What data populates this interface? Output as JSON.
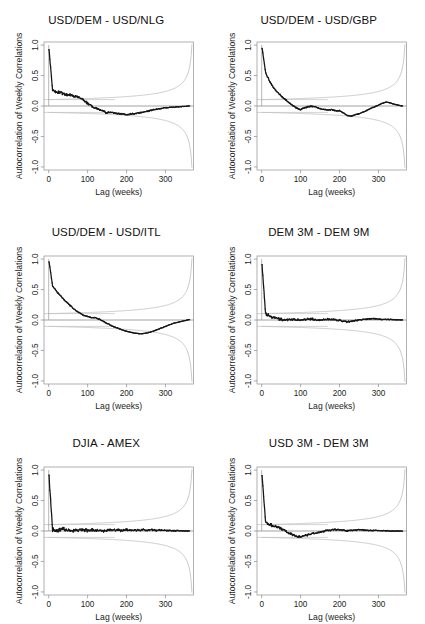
{
  "figure": {
    "kind": "acf-panel-grid",
    "rows": 3,
    "cols": 2,
    "background": "#ffffff",
    "ink": "#161616",
    "band_color": "#b9b9b9"
  },
  "axes": {
    "xlabel": "Lag (weeks)",
    "ylabel": "Autocorrelation of Weekly Correlations",
    "xticks": [
      "0",
      "100",
      "200",
      "300"
    ],
    "xtick_values": [
      0,
      100,
      200,
      300
    ],
    "yticks": [
      "-1.0",
      "-0.5",
      "0.0",
      "0.5",
      "1.0"
    ],
    "ytick_values": [
      -1.0,
      -0.5,
      0.0,
      0.5,
      1.0
    ],
    "xlim": [
      -12,
      372
    ],
    "ylim": [
      -1.05,
      1.05
    ],
    "grid": false,
    "legend": "none"
  },
  "chart_data": {
    "type": "line",
    "xlabel": "Lag (weeks)",
    "ylabel": "Autocorrelation of Weekly Correlations",
    "xlim": [
      -12,
      372
    ],
    "ylim": [
      -1.05,
      1.05
    ],
    "grid": false,
    "x": [
      0,
      10,
      20,
      30,
      40,
      50,
      60,
      70,
      80,
      90,
      100,
      110,
      120,
      130,
      140,
      150,
      160,
      170,
      180,
      190,
      200,
      210,
      220,
      230,
      240,
      250,
      260,
      270,
      280,
      290,
      300,
      310,
      320,
      330,
      340,
      350,
      360
    ],
    "panels": [
      {
        "title": "USD/DEM - USD/NLG",
        "row": 0,
        "col": 0,
        "lag0": 1.0,
        "ci_at_small_lag": 0.105,
        "values": [
          1.0,
          0.26,
          0.23,
          0.22,
          0.2,
          0.18,
          0.17,
          0.155,
          0.14,
          0.1,
          0.045,
          0.0,
          -0.035,
          -0.055,
          -0.085,
          -0.115,
          -0.105,
          -0.115,
          -0.125,
          -0.135,
          -0.145,
          -0.135,
          -0.125,
          -0.115,
          -0.105,
          -0.09,
          -0.075,
          -0.06,
          -0.05,
          -0.04,
          -0.03,
          -0.025,
          -0.02,
          -0.015,
          -0.01,
          -0.005,
          0.0
        ]
      },
      {
        "title": "USD/DEM - USD/GBP",
        "row": 0,
        "col": 1,
        "lag0": 1.0,
        "ci_at_small_lag": 0.105,
        "values": [
          1.0,
          0.55,
          0.41,
          0.31,
          0.23,
          0.165,
          0.11,
          0.055,
          0.01,
          -0.035,
          -0.06,
          -0.03,
          -0.01,
          -0.005,
          -0.02,
          -0.045,
          -0.06,
          -0.065,
          -0.06,
          -0.08,
          -0.075,
          -0.115,
          -0.155,
          -0.165,
          -0.145,
          -0.125,
          -0.1,
          -0.075,
          -0.04,
          -0.015,
          0.015,
          0.045,
          0.065,
          0.05,
          0.03,
          0.015,
          0.0
        ]
      },
      {
        "title": "USD/DEM - USD/ITL",
        "row": 1,
        "col": 0,
        "lag0": 1.0,
        "ci_at_small_lag": 0.105,
        "values": [
          1.0,
          0.56,
          0.47,
          0.4,
          0.33,
          0.27,
          0.21,
          0.155,
          0.115,
          0.075,
          0.06,
          0.04,
          0.035,
          0.015,
          -0.02,
          -0.055,
          -0.09,
          -0.115,
          -0.14,
          -0.165,
          -0.185,
          -0.2,
          -0.215,
          -0.225,
          -0.225,
          -0.215,
          -0.2,
          -0.18,
          -0.155,
          -0.13,
          -0.105,
          -0.08,
          -0.055,
          -0.04,
          -0.025,
          -0.01,
          0.005
        ]
      },
      {
        "title": "DEM 3M - DEM 9M",
        "row": 1,
        "col": 1,
        "lag0": 1.0,
        "ci_at_small_lag": 0.105,
        "values": [
          1.0,
          0.1,
          0.065,
          0.045,
          0.025,
          0.015,
          0.0,
          0.005,
          0.015,
          0.005,
          -0.005,
          0.01,
          0.02,
          0.015,
          0.0,
          -0.005,
          0.005,
          0.015,
          0.01,
          0.0,
          -0.005,
          -0.02,
          -0.03,
          -0.025,
          -0.01,
          0.005,
          0.01,
          0.015,
          0.02,
          0.02,
          0.015,
          0.01,
          0.01,
          0.01,
          0.005,
          0.005,
          0.0
        ]
      },
      {
        "title": "DJIA - AMEX",
        "row": 2,
        "col": 0,
        "lag0": 1.0,
        "ci_at_small_lag": 0.105,
        "values": [
          1.0,
          0.02,
          0.015,
          0.02,
          0.025,
          0.02,
          0.01,
          0.02,
          0.015,
          0.005,
          0.015,
          0.02,
          0.01,
          0.015,
          0.005,
          0.01,
          0.015,
          0.02,
          0.015,
          0.01,
          0.02,
          0.015,
          0.01,
          0.015,
          0.02,
          0.015,
          0.02,
          0.015,
          0.01,
          0.015,
          0.01,
          0.01,
          0.005,
          0.005,
          0.005,
          0.0,
          0.0
        ]
      },
      {
        "title": "USD 3M - DEM 3M",
        "row": 2,
        "col": 1,
        "lag0": 1.0,
        "ci_at_small_lag": 0.105,
        "values": [
          1.0,
          0.145,
          0.11,
          0.085,
          0.065,
          0.04,
          0.01,
          -0.035,
          -0.065,
          -0.085,
          -0.09,
          -0.075,
          -0.06,
          -0.045,
          -0.035,
          -0.02,
          -0.005,
          0.01,
          0.02,
          0.025,
          0.02,
          0.015,
          0.005,
          0.01,
          0.015,
          0.02,
          0.015,
          0.01,
          0.01,
          0.01,
          0.005,
          0.005,
          0.005,
          0.0,
          0.0,
          0.0,
          0.0
        ]
      }
    ]
  }
}
